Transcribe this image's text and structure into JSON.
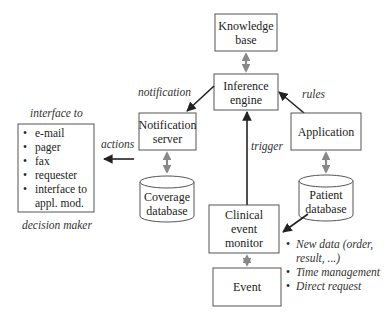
{
  "nodes": {
    "knowledge_base": [
      "Knowledge",
      "base"
    ],
    "inference_engine": [
      "Inference",
      "engine"
    ],
    "notification_server": [
      "Notification",
      "server"
    ],
    "application": [
      "Application"
    ],
    "coverage_database": [
      "Coverage",
      "database"
    ],
    "patient_database": [
      "Patient",
      "database"
    ],
    "clinical_event_monitor": [
      "Clinical",
      "event",
      "monitor"
    ],
    "event": [
      "Event"
    ]
  },
  "edge_labels": {
    "notification": "notification",
    "rules": "rules",
    "trigger": "trigger",
    "actions": "actions"
  },
  "interface_box": {
    "title": "interface to",
    "items": [
      "e-mail",
      "pager",
      "fax",
      "requester",
      "interface to",
      "appl. mod."
    ],
    "footer": "decision maker"
  },
  "event_types": [
    [
      "New data (order,",
      "result, ...)"
    ],
    [
      "Time management"
    ],
    [
      "Direct request"
    ]
  ],
  "bullet": "•"
}
